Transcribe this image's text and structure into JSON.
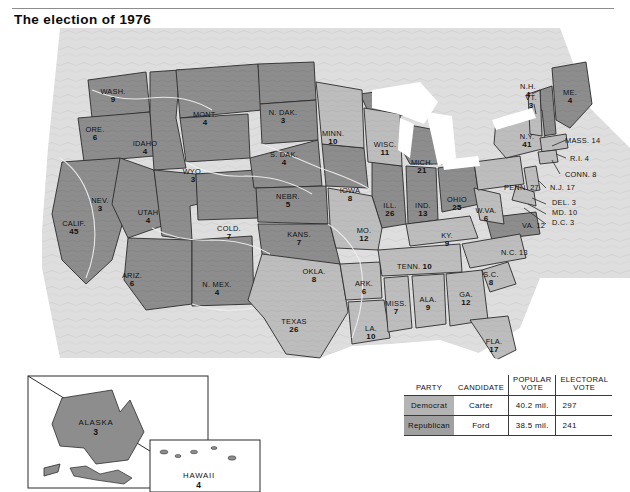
{
  "page": {
    "title": "The election of 1976"
  },
  "colors": {
    "democrat_fill": "#b9b9b9",
    "republican_fill": "#8a8a8a",
    "water": "#ffffff",
    "terrain_background": "#dcdcdc",
    "border": "#2b2b2b",
    "text": "#111111"
  },
  "map": {
    "name": "united-states-electoral-map-1976",
    "states": [
      {
        "code": "WASH",
        "label": "WASH.",
        "ev": "9",
        "party": "Republican",
        "x": 113,
        "y": 68
      },
      {
        "code": "ORE",
        "label": "ORE.",
        "ev": "6",
        "party": "Republican",
        "x": 95,
        "y": 106
      },
      {
        "code": "CALIF",
        "label": "CALIF.",
        "ev": "45",
        "party": "Republican",
        "x": 74,
        "y": 200
      },
      {
        "code": "IDAHO",
        "label": "IDAHO",
        "ev": "4",
        "party": "Republican",
        "x": 145,
        "y": 120
      },
      {
        "code": "NEV",
        "label": "NEV.",
        "ev": "3",
        "party": "Republican",
        "x": 100,
        "y": 177
      },
      {
        "code": "UTAH",
        "label": "UTAH",
        "ev": "4",
        "party": "Republican",
        "x": 148,
        "y": 189
      },
      {
        "code": "ARIZ",
        "label": "ARIZ.",
        "ev": "6",
        "party": "Republican",
        "x": 132,
        "y": 252
      },
      {
        "code": "MONT",
        "label": "MONT.",
        "ev": "4",
        "party": "Republican",
        "x": 205,
        "y": 91
      },
      {
        "code": "WYO",
        "label": "WYO.",
        "ev": "3",
        "party": "Republican",
        "x": 193,
        "y": 148
      },
      {
        "code": "COLO",
        "label": "COLD.",
        "ev": "7",
        "party": "Republican",
        "x": 229,
        "y": 205
      },
      {
        "code": "NMEX",
        "label": "N. MEX.",
        "ev": "4",
        "party": "Republican",
        "x": 217,
        "y": 261
      },
      {
        "code": "NDAK",
        "label": "N. DAK.",
        "ev": "3",
        "party": "Republican",
        "x": 283,
        "y": 89
      },
      {
        "code": "SDAK",
        "label": "S. DAK.",
        "ev": "4",
        "party": "Republican",
        "x": 284,
        "y": 131
      },
      {
        "code": "NEBR",
        "label": "NEBR.",
        "ev": "5",
        "party": "Republican",
        "x": 288,
        "y": 173
      },
      {
        "code": "KANS",
        "label": "KANS.",
        "ev": "7",
        "party": "Republican",
        "x": 299,
        "y": 211
      },
      {
        "code": "OKLA",
        "label": "OKLA.",
        "ev": "8",
        "party": "Republican",
        "x": 314,
        "y": 248
      },
      {
        "code": "TEXAS",
        "label": "TEXAS",
        "ev": "26",
        "party": "Democrat",
        "x": 294,
        "y": 298
      },
      {
        "code": "MINN",
        "label": "MINN.",
        "ev": "10",
        "party": "Democrat",
        "x": 333,
        "y": 110
      },
      {
        "code": "IOWA",
        "label": "IOWA",
        "ev": "8",
        "party": "Republican",
        "x": 350,
        "y": 167
      },
      {
        "code": "MO",
        "label": "MO.",
        "ev": "12",
        "party": "Democrat",
        "x": 364,
        "y": 207
      },
      {
        "code": "ARK",
        "label": "ARK.",
        "ev": "6",
        "party": "Democrat",
        "x": 364,
        "y": 260
      },
      {
        "code": "LA",
        "label": "LA.",
        "ev": "10",
        "party": "Democrat",
        "x": 371,
        "y": 305
      },
      {
        "code": "WISC",
        "label": "WISC.",
        "ev": "11",
        "party": "Democrat",
        "x": 385,
        "y": 121
      },
      {
        "code": "ILL",
        "label": "ILL.",
        "ev": "26",
        "party": "Republican",
        "x": 390,
        "y": 182
      },
      {
        "code": "MISS",
        "label": "MISS.",
        "ev": "7",
        "party": "Democrat",
        "x": 396,
        "y": 280
      },
      {
        "code": "MICH",
        "label": "MICH.",
        "ev": "21",
        "party": "Republican",
        "x": 422,
        "y": 139
      },
      {
        "code": "IND",
        "label": "IND.",
        "ev": "13",
        "party": "Republican",
        "x": 423,
        "y": 182
      },
      {
        "code": "TENN",
        "label": "TENN.",
        "ev": "10",
        "party": "Democrat",
        "x": 397,
        "y": 239,
        "inline": true
      },
      {
        "code": "ALA",
        "label": "ALA.",
        "ev": "9",
        "party": "Democrat",
        "x": 428,
        "y": 276
      },
      {
        "code": "GA",
        "label": "GA.",
        "ev": "12",
        "party": "Democrat",
        "x": 466,
        "y": 271
      },
      {
        "code": "OHIO",
        "label": "OHIO",
        "ev": "25",
        "party": "Republican",
        "x": 457,
        "y": 176
      },
      {
        "code": "KY",
        "label": "KY.",
        "ev": "9",
        "party": "Democrat",
        "x": 447,
        "y": 212
      },
      {
        "code": "WVA",
        "label": "W.VA.",
        "ev": "6",
        "party": "Democrat",
        "x": 486,
        "y": 187
      },
      {
        "code": "SC",
        "label": "S.C.",
        "ev": "8",
        "party": "Democrat",
        "x": 491,
        "y": 251
      },
      {
        "code": "FLA",
        "label": "FLA.",
        "ev": "17",
        "party": "Democrat",
        "x": 494,
        "y": 318
      },
      {
        "code": "PENN",
        "label": "PENN. 27",
        "ev": "",
        "party": "Democrat",
        "x": 504,
        "y": 160,
        "inline": true
      },
      {
        "code": "NC",
        "label": "N.C. 13",
        "ev": "",
        "party": "Democrat",
        "x": 501,
        "y": 225,
        "inline": true
      },
      {
        "code": "VA",
        "label": "VA. 12",
        "ev": "",
        "party": "Republican",
        "x": 522,
        "y": 198,
        "inline": true
      },
      {
        "code": "NY",
        "label": "N.Y.",
        "ev": "41",
        "party": "Democrat",
        "x": 527,
        "y": 113
      },
      {
        "code": "VT",
        "label": "VT.",
        "ev": "3",
        "party": "Democrat",
        "x": 531,
        "y": 74
      },
      {
        "code": "NH",
        "label": "N.H.",
        "ev": "4",
        "party": "Republican",
        "x": 528,
        "y": 63
      },
      {
        "code": "ME",
        "label": "ME.",
        "ev": "4",
        "party": "Republican",
        "x": 570,
        "y": 69
      },
      {
        "code": "MASS",
        "label": "MASS. 14",
        "ev": "",
        "party": "Democrat",
        "x": 565,
        "y": 113,
        "inline": true
      },
      {
        "code": "RI",
        "label": "R.I. 4",
        "ev": "",
        "party": "Democrat",
        "x": 570,
        "y": 131,
        "inline": true
      },
      {
        "code": "CONN",
        "label": "CONN. 8",
        "ev": "",
        "party": "Democrat",
        "x": 565,
        "y": 147,
        "inline": true
      },
      {
        "code": "NJ",
        "label": "N.J. 17",
        "ev": "",
        "party": "Democrat",
        "x": 550,
        "y": 160,
        "inline": true
      },
      {
        "code": "DEL",
        "label": "DEL. 3",
        "ev": "",
        "party": "Democrat",
        "x": 552,
        "y": 175,
        "inline": true
      },
      {
        "code": "MD",
        "label": "MD. 10",
        "ev": "",
        "party": "Democrat",
        "x": 552,
        "y": 185,
        "inline": true
      },
      {
        "code": "DC",
        "label": "D.C. 3",
        "ev": "",
        "party": "Democrat",
        "x": 552,
        "y": 195,
        "inline": true
      }
    ],
    "insets": [
      {
        "code": "ALASKA",
        "label": "ALASKA",
        "ev": "3",
        "party": "Republican",
        "x": 96,
        "y": 400
      },
      {
        "code": "HAWAII",
        "label": "HAWAII",
        "ev": "4",
        "party": "Democrat",
        "x": 199,
        "y": 453
      }
    ]
  },
  "legend": {
    "name": "election-results-legend",
    "headers": {
      "party": "PARTY",
      "candidate": "CANDIDATE",
      "popular_vote_line1": "POPULAR",
      "popular_vote_line2": "VOTE",
      "electoral_vote_line1": "ELECTORAL",
      "electoral_vote_line2": "VOTE"
    },
    "rows": [
      {
        "party": "Democrat",
        "candidate": "Carter",
        "popular_vote": "40.2 mil.",
        "electoral_vote": "297"
      },
      {
        "party": "Republican",
        "candidate": "Ford",
        "popular_vote": "38.5 mil.",
        "electoral_vote": "241"
      }
    ]
  }
}
